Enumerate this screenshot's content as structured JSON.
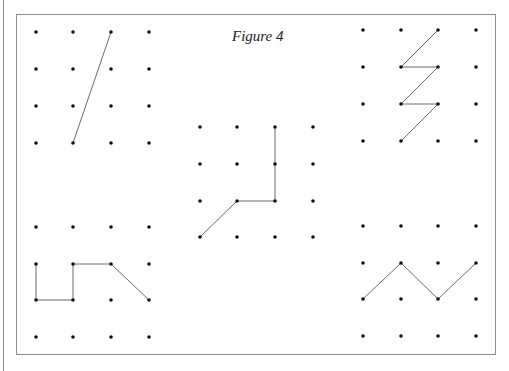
{
  "caption": "Figure 4",
  "colors": {
    "dot": "#111111",
    "line": "#6a6a6a",
    "frame": "#8c8c8c"
  },
  "grids": [
    {
      "id": "top-left",
      "xs": [
        36,
        73,
        111,
        149
      ],
      "ys": [
        32,
        69,
        106,
        143
      ],
      "path": [
        [
          2,
          0
        ],
        [
          1,
          3
        ]
      ]
    },
    {
      "id": "top-right",
      "xs": [
        363,
        401,
        438,
        476
      ],
      "ys": [
        30,
        67,
        104,
        141
      ],
      "path": [
        [
          2,
          0
        ],
        [
          1,
          1
        ],
        [
          2,
          1
        ],
        [
          1,
          2
        ],
        [
          2,
          2
        ],
        [
          1,
          3
        ]
      ]
    },
    {
      "id": "center",
      "xs": [
        200,
        237,
        275,
        313
      ],
      "ys": [
        127,
        164,
        201,
        237
      ],
      "path": [
        [
          2,
          0
        ],
        [
          2,
          1
        ],
        [
          2,
          2
        ],
        [
          1,
          2
        ],
        [
          0,
          3
        ]
      ]
    },
    {
      "id": "bottom-left",
      "xs": [
        36,
        73,
        111,
        149
      ],
      "ys": [
        227,
        264,
        300,
        337
      ],
      "path": [
        [
          0,
          1
        ],
        [
          0,
          2
        ],
        [
          1,
          2
        ],
        [
          1,
          1
        ],
        [
          2,
          1
        ],
        [
          3,
          2
        ]
      ]
    },
    {
      "id": "bottom-right",
      "xs": [
        363,
        401,
        438,
        476
      ],
      "ys": [
        226,
        263,
        299,
        336
      ],
      "path": [
        [
          0,
          2
        ],
        [
          1,
          1
        ],
        [
          2,
          2
        ],
        [
          3,
          1
        ]
      ]
    }
  ]
}
